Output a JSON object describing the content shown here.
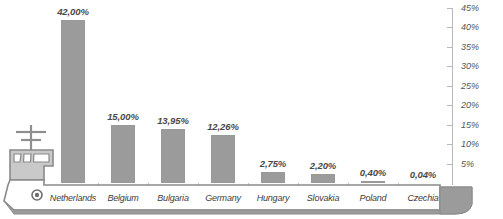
{
  "chart_data": {
    "type": "bar",
    "title": "",
    "xlabel": "",
    "ylabel": "",
    "ylim": [
      0,
      45
    ],
    "grid": false,
    "legend": "none",
    "axis_position": "right",
    "decimal_separator": ",",
    "categories": [
      "Netherlands",
      "Belgium",
      "Bulgaria",
      "Germany",
      "Hungary",
      "Slovakia",
      "Poland",
      "Czechia"
    ],
    "values": [
      42.0,
      15.0,
      13.95,
      12.26,
      2.75,
      2.2,
      0.4,
      0.04
    ],
    "value_labels": [
      "42,00%",
      "15,00%",
      "13,95%",
      "12,26%",
      "2,75%",
      "2,20%",
      "0,40%",
      "0,04%"
    ],
    "tick_labels": [
      "5%",
      "10%",
      "15%",
      "20%",
      "25%",
      "30%",
      "35%",
      "40%",
      "45%"
    ],
    "tick_values": [
      5,
      10,
      15,
      20,
      25,
      30,
      35,
      40,
      45
    ],
    "bar_color": "#9b9b9b",
    "axis_color": "#b9b9b9",
    "text_color": "#4a4a4a"
  },
  "decoration": {
    "ship_icon": "ship-bridge-icon",
    "porthole_icon": "porthole-icon",
    "mast_icon": "mast-icon",
    "hull_color": "#9b9b9b",
    "hull_fill": "#ffffff"
  }
}
